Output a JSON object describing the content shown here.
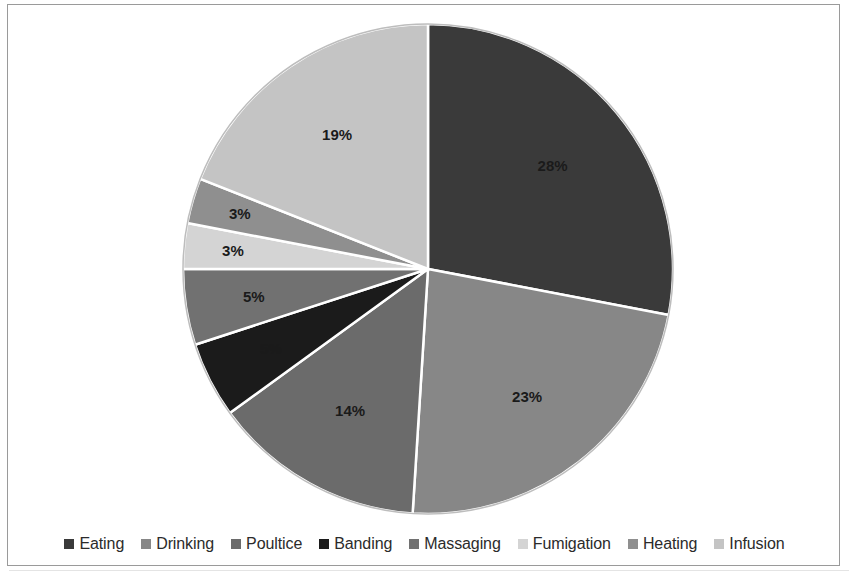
{
  "chart_data": {
    "type": "pie",
    "title": "",
    "subtitle": "",
    "xlabel": "",
    "ylabel": "",
    "legend_position": "bottom",
    "grid": false,
    "start_angle_deg": 0,
    "direction": "clockwise",
    "categories": [
      "Eating",
      "Drinking",
      "Poultice",
      "Banding",
      "Massaging",
      "Fumigation",
      "Heating",
      "Infusion"
    ],
    "values": [
      28,
      23,
      14,
      5,
      5,
      3,
      3,
      19
    ],
    "data_labels": [
      "28%",
      "23%",
      "14%",
      "5%",
      "5%",
      "3%",
      "3%",
      "19%"
    ],
    "colors": [
      "#3a3a3a",
      "#878787",
      "#6b6b6b",
      "#1b1b1b",
      "#717171",
      "#d4d4d4",
      "#8f8f8f",
      "#c4c4c4"
    ],
    "slices": [
      {
        "label": "Eating",
        "value": 28,
        "display": "28%",
        "color": "#3a3a3a"
      },
      {
        "label": "Drinking",
        "value": 23,
        "display": "23%",
        "color": "#878787"
      },
      {
        "label": "Poultice",
        "value": 14,
        "display": "14%",
        "color": "#6b6b6b"
      },
      {
        "label": "Banding",
        "value": 5,
        "display": "5%",
        "color": "#1b1b1b"
      },
      {
        "label": "Massaging",
        "value": 5,
        "display": "5%",
        "color": "#717171"
      },
      {
        "label": "Fumigation",
        "value": 3,
        "display": "3%",
        "color": "#d4d4d4"
      },
      {
        "label": "Heating",
        "value": 3,
        "display": "3%",
        "color": "#8f8f8f"
      },
      {
        "label": "Infusion",
        "value": 19,
        "display": "19%",
        "color": "#c4c4c4"
      }
    ]
  },
  "legend": {
    "items": [
      {
        "label": "Eating",
        "color": "#3a3a3a"
      },
      {
        "label": "Drinking",
        "color": "#878787"
      },
      {
        "label": "Poultice",
        "color": "#6b6b6b"
      },
      {
        "label": "Banding",
        "color": "#1b1b1b"
      },
      {
        "label": "Massaging",
        "color": "#717171"
      },
      {
        "label": "Fumigation",
        "color": "#d4d4d4"
      },
      {
        "label": "Heating",
        "color": "#8f8f8f"
      },
      {
        "label": "Infusion",
        "color": "#c4c4c4"
      }
    ]
  },
  "style": {
    "background": "#ffffff",
    "frame_border": "#9a9a9a",
    "slice_outline": "#ffffff",
    "label_text": "#1a1a1a"
  }
}
